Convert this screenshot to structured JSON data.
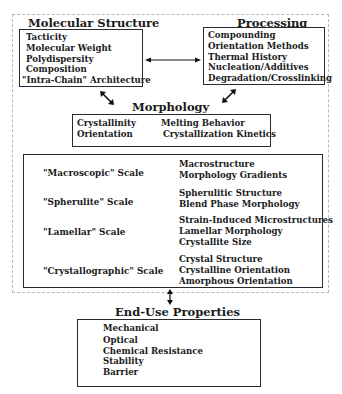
{
  "molecular_structure": {
    "title": "Molecular Structure",
    "items": [
      "Tacticity",
      "Molecular Weight",
      "Polydispersity",
      "Composition",
      "\"Intra-Chain\" Architecture"
    ]
  },
  "processing": {
    "title": "Processing",
    "items": [
      "Compounding",
      "Orientation Methods",
      "Thermal History",
      "Nucleation/Additives",
      "Degradation/Crosslinking"
    ]
  },
  "morphology": {
    "title": "Morphology",
    "left_items": [
      "Crystallinity",
      "Orientation"
    ],
    "right_items": [
      "Melting Behavior",
      "Crystallization Kinetics"
    ]
  },
  "scales": [
    {
      "label": "\"Macroscopic\" Scale",
      "items": [
        "Macrostructure",
        "Morphology Gradients"
      ]
    },
    {
      "label": "\"Spherulite\" Scale",
      "items": [
        "Spherulitic Structure",
        "Blend Phase Morphology"
      ]
    },
    {
      "label": "\"Lamellar\" Scale",
      "items": [
        "Strain-Induced Microstructures",
        "Lamellar Morphology",
        "Crystallite Size"
      ]
    },
    {
      "label": "\"Crystallographic\" Scale",
      "items": [
        "Crystal Structure",
        "Crystalline Orientation",
        "Amorphous Orientation"
      ]
    }
  ],
  "end_use": {
    "title": "End-Use Properties",
    "items": [
      "Mechanical",
      "Optical",
      "Chemical Resistance",
      "Stability",
      "Barrier"
    ]
  }
}
